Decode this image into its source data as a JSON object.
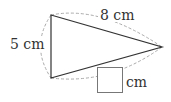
{
  "diagram": {
    "type": "triangle",
    "labels": {
      "top_side": "8 cm",
      "left_side": "5 cm",
      "answer_unit": "cm"
    },
    "answer_box": ""
  }
}
